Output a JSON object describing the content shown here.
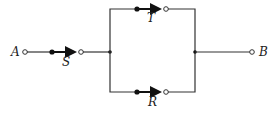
{
  "diagram": {
    "type": "switching-circuit",
    "terminals": {
      "left": "A",
      "right": "B"
    },
    "switches": [
      {
        "label": "S",
        "position": "series"
      },
      {
        "label": "T",
        "position": "parallel-top"
      },
      {
        "label": "R",
        "position": "parallel-bottom"
      }
    ],
    "colors": {
      "line": "#333333",
      "background": "#ffffff"
    }
  }
}
